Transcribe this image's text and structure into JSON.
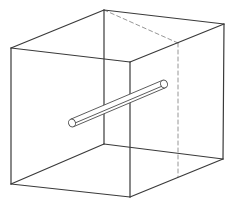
{
  "diagram": {
    "title": "",
    "colors": {
      "background": "#ffffff",
      "edge": "#3a3a3a",
      "hidden_edge": "#8a8a8a",
      "cylinder": "#4a4a4a"
    },
    "cube": {
      "vertices": {
        "front_top_left": [
          11,
          48
        ],
        "front_top_right": [
          130,
          62
        ],
        "front_bottom_left": [
          11,
          184
        ],
        "front_bottom_right": [
          130,
          197
        ],
        "back_top_left": [
          104,
          10
        ],
        "back_top_right": [
          224,
          24
        ],
        "back_bottom_left": [
          104,
          144
        ],
        "back_bottom_right": [
          223,
          159
        ],
        "hidden_top": [
          178,
          43
        ],
        "hidden_bottom": [
          178,
          177
        ]
      }
    },
    "cylinder": {
      "start": [
        72,
        123
      ],
      "end": [
        164,
        84
      ],
      "radius": 4
    }
  }
}
